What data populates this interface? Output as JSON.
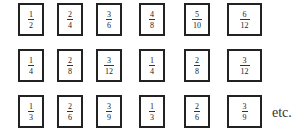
{
  "rows": [
    [
      {
        "num": "1",
        "den": "2"
      },
      {
        "num": "2",
        "den": "4"
      },
      {
        "num": "3",
        "den": "6"
      },
      {
        "num": "4",
        "den": "8"
      },
      {
        "num": "5",
        "den": "10"
      },
      {
        "num": "6",
        "den": "12"
      }
    ],
    [
      {
        "num": "1",
        "den": "4"
      },
      {
        "num": "2",
        "den": "8"
      },
      {
        "num": "3",
        "den": "12"
      },
      {
        "num": "1",
        "den": "4"
      },
      {
        "num": "2",
        "den": "8"
      },
      {
        "num": "3",
        "den": "12"
      }
    ],
    [
      {
        "num": "1",
        "den": "3"
      },
      {
        "num": "2",
        "den": "6"
      },
      {
        "num": "3",
        "den": "9"
      },
      {
        "num": "1",
        "den": "3"
      },
      {
        "num": "2",
        "den": "6"
      },
      {
        "num": "3",
        "den": "9"
      }
    ]
  ],
  "trailing_text": "etc."
}
